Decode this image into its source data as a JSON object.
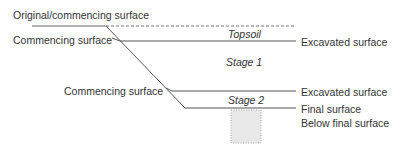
{
  "labels": {
    "original_surface": "Original/commencing surface",
    "commencing_surface_1": "Commencing surface",
    "commencing_surface_2": "Commencing surface",
    "topsoil": "Topsoil",
    "stage1": "Stage 1",
    "stage2": "Stage 2",
    "excavated_surface_1": "Excavated surface",
    "excavated_surface_2": "Excavated surface",
    "final_surface": "Final surface",
    "below_final_surface": "Below final surface"
  },
  "colors": {
    "line": "#555555",
    "text": "#333333",
    "box_fill": "#e8e8e8"
  }
}
